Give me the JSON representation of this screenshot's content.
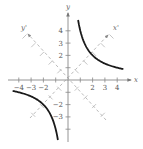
{
  "figure": {
    "type": "rotated-hyperbola",
    "equation_implied": "xy = 4",
    "colors": {
      "axis": "#888888",
      "rotated_axis": "#aaaaaa",
      "curve": "#1a1a1a",
      "label": "#555555"
    },
    "axes": {
      "x_label": "x",
      "y_label": "y",
      "x_prime_label": "x'",
      "y_prime_label": "y'",
      "x_ticks": [
        {
          "value": -4,
          "label": "−4"
        },
        {
          "value": -3,
          "label": "−3"
        },
        {
          "value": -2,
          "label": "−2"
        },
        {
          "value": -1,
          "label": ""
        },
        {
          "value": 1,
          "label": ""
        },
        {
          "value": 2,
          "label": "2"
        },
        {
          "value": 3,
          "label": "3"
        },
        {
          "value": 4,
          "label": "4"
        }
      ],
      "y_ticks": [
        {
          "value": 4,
          "label": "4"
        },
        {
          "value": 3,
          "label": "3"
        },
        {
          "value": 2,
          "label": "2"
        },
        {
          "value": 1,
          "label": ""
        },
        {
          "value": -1,
          "label": ""
        },
        {
          "value": -2,
          "label": "−2"
        },
        {
          "value": -3,
          "label": "−3"
        },
        {
          "value": -4,
          "label": ""
        }
      ],
      "xlim": [
        -5.5,
        5
      ],
      "ylim": [
        -5,
        5.3
      ],
      "grid": false
    },
    "curves": [
      {
        "name": "upper-right-branch",
        "x_range": [
          0.82,
          4.5
        ]
      },
      {
        "name": "lower-left-branch",
        "x_range": [
          -4.5,
          -0.82
        ]
      }
    ]
  }
}
